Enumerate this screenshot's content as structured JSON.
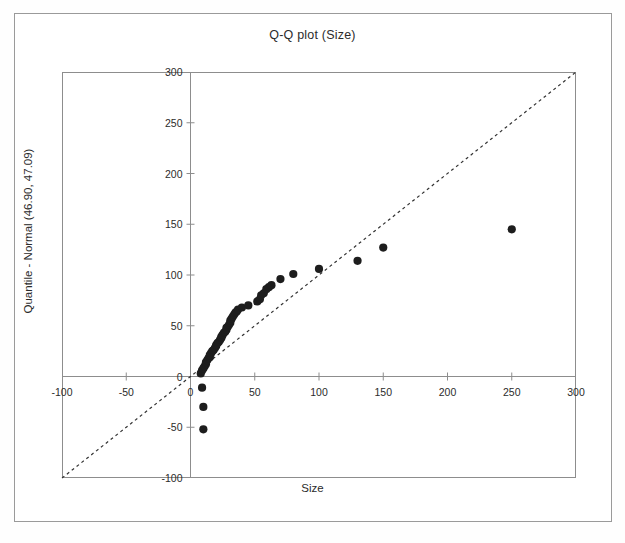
{
  "chart_data": {
    "type": "scatter",
    "title": "Q-Q plot (Size)",
    "xlabel": "Size",
    "ylabel": "Quantile - Normal (46.90, 47.09)",
    "xlim": [
      -100,
      300
    ],
    "ylim": [
      -100,
      300
    ],
    "grid": false,
    "legend": null,
    "xticks": [
      -100,
      -50,
      0,
      50,
      100,
      150,
      200,
      250,
      300
    ],
    "xtick_labels": [
      "-100",
      "-50",
      "0",
      "50",
      "100",
      "150",
      "200",
      "250",
      "300"
    ],
    "yticks": [
      -100,
      -50,
      0,
      50,
      100,
      150,
      200,
      250,
      300
    ],
    "ytick_labels": [
      "-100",
      "-50",
      "0",
      "50",
      "100",
      "150",
      "200",
      "250",
      "300"
    ],
    "reference_line": {
      "style": "dashed",
      "color": "#333333",
      "from": [
        -100,
        -100
      ],
      "to": [
        300,
        300
      ],
      "description": "45-degree normal reference line"
    },
    "series": [
      {
        "name": "Size quantiles",
        "marker": "filled-circle",
        "color": "#1d1d1d",
        "points": [
          [
            10,
            -52
          ],
          [
            10,
            -30
          ],
          [
            9,
            -11
          ],
          [
            8,
            3
          ],
          [
            9,
            6
          ],
          [
            10,
            8
          ],
          [
            11,
            10
          ],
          [
            12,
            12
          ],
          [
            12,
            14
          ],
          [
            13,
            16
          ],
          [
            14,
            18
          ],
          [
            15,
            19
          ],
          [
            15,
            21
          ],
          [
            16,
            23
          ],
          [
            17,
            25
          ],
          [
            18,
            26
          ],
          [
            19,
            28
          ],
          [
            20,
            30
          ],
          [
            20,
            31
          ],
          [
            21,
            33
          ],
          [
            22,
            34
          ],
          [
            23,
            36
          ],
          [
            24,
            38
          ],
          [
            24,
            39
          ],
          [
            25,
            41
          ],
          [
            26,
            43
          ],
          [
            27,
            44
          ],
          [
            28,
            46
          ],
          [
            28,
            48
          ],
          [
            29,
            49
          ],
          [
            30,
            51
          ],
          [
            31,
            53
          ],
          [
            31,
            55
          ],
          [
            32,
            57
          ],
          [
            33,
            59
          ],
          [
            34,
            61
          ],
          [
            35,
            63
          ],
          [
            36,
            64
          ],
          [
            37,
            66
          ],
          [
            40,
            68
          ],
          [
            45,
            70
          ],
          [
            52,
            74
          ],
          [
            54,
            76
          ],
          [
            55,
            80
          ],
          [
            57,
            82
          ],
          [
            59,
            86
          ],
          [
            61,
            88
          ],
          [
            63,
            90
          ],
          [
            70,
            96
          ],
          [
            80,
            101
          ],
          [
            100,
            106
          ],
          [
            130,
            114
          ],
          [
            150,
            127
          ],
          [
            250,
            145
          ]
        ]
      }
    ]
  },
  "figure": {
    "background": "#ffffff",
    "border_color": "#9a9a9a",
    "frame_color": "#8d8d8d"
  }
}
